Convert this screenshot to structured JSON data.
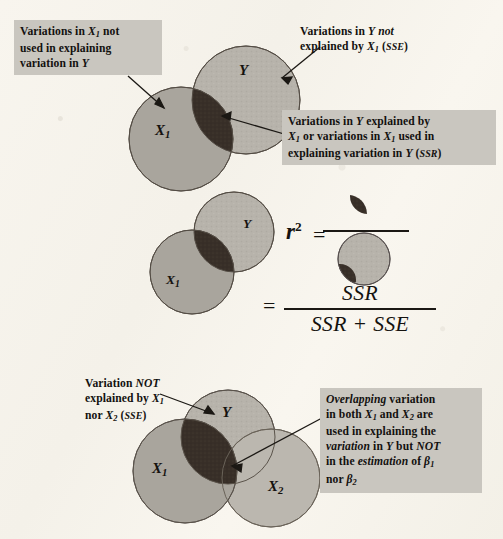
{
  "figure": {
    "background_color": "#f7f4ec",
    "label_box_color": "#c9c6bf",
    "colors": {
      "circle_y": "#b9b5ad",
      "circle_x1": "#a8a49c",
      "circle_x2": "#bfbbb2",
      "overlap_dark": "#3a312a",
      "outline": "#4a443c",
      "arrow": "#1b1814",
      "text": "#13110f"
    }
  },
  "panels": [
    {
      "id": "panel-top",
      "name": "simple-regression-venn",
      "circles": [
        {
          "name": "circle-y",
          "label": "Y",
          "cx": 246,
          "cy": 100,
          "r": 54
        },
        {
          "name": "circle-x1",
          "label": "X",
          "label_sub": "1",
          "cx": 181,
          "cy": 139,
          "r": 52
        }
      ],
      "callouts": [
        {
          "name": "callout-x1-unused",
          "lines": [
            "Variations in X<sub>1</sub> not",
            "used in explaining",
            "variation in Y"
          ],
          "plain": "Variations in X1 not used in explaining variation in Y"
        },
        {
          "name": "callout-y-unexplained-sse",
          "lines": [
            "Variations in Y not",
            "explained by X<sub>1</sub> (SSE)"
          ],
          "plain": "Variations in Y not explained by X1 (SSE)"
        },
        {
          "name": "callout-ssr",
          "lines": [
            "Variations in Y explained by",
            "X<sub>1</sub> or variations in X<sub>1</sub> used in",
            "explaining variation in Y (SSR)"
          ],
          "plain": "Variations in Y explained by X1 or variations in X1 used in explaining variation in Y (SSR)"
        }
      ]
    },
    {
      "id": "panel-middle",
      "name": "r-squared-definition",
      "circles": [
        {
          "name": "circle-y",
          "label": "Y",
          "cx": 234,
          "cy": 232,
          "r": 40
        },
        {
          "name": "circle-x1",
          "label": "X",
          "label_sub": "1",
          "cx": 192,
          "cy": 272,
          "r": 42
        }
      ],
      "equation": {
        "symbol": "r",
        "exponent": "2",
        "equals": "=",
        "numerator": "SSR",
        "denominator": "SSR + SSE",
        "pictorial_numerator": "dark-lens-overlap",
        "pictorial_denominator": "full-y-circle-with-dark-lens"
      }
    },
    {
      "id": "panel-bottom",
      "name": "multiple-regression-venn",
      "circles": [
        {
          "name": "circle-y",
          "label": "Y",
          "cx": 228,
          "cy": 437,
          "r": 47
        },
        {
          "name": "circle-x1",
          "label": "X",
          "label_sub": "1",
          "cx": 185,
          "cy": 471,
          "r": 52
        },
        {
          "name": "circle-x2",
          "label": "X",
          "label_sub": "2",
          "cx": 271,
          "cy": 478,
          "r": 49
        }
      ],
      "callouts": [
        {
          "name": "callout-sse-not-explained",
          "lines": [
            "Variation NOT",
            "explained by X<sub>1</sub>",
            "nor X<sub>2</sub> (SSE)"
          ],
          "plain": "Variation NOT explained by X1 nor X2 (SSE)"
        },
        {
          "name": "callout-overlapping-variation",
          "lines": [
            "Overlapping variation",
            "in both X<sub>1</sub> and X<sub>2</sub> are",
            "used in explaining the",
            "variation in Y but NOT",
            "in the estimation of β<sub>1</sub>",
            "nor β<sub>2</sub>"
          ],
          "plain": "Overlapping variation in both X1 and X2 are used in explaining the variation in Y but NOT in the estimation of β1 nor β2"
        }
      ]
    }
  ],
  "glyphs": {
    "letter_y": "Y",
    "letter_x": "X",
    "beta": "β",
    "sub_1": "1",
    "sub_2": "2",
    "sse": "SSE",
    "ssr": "SSR",
    "not": "NOT",
    "overlapping": "Overlapping",
    "variation_italic": "variation",
    "estimation_italic": "estimation"
  }
}
